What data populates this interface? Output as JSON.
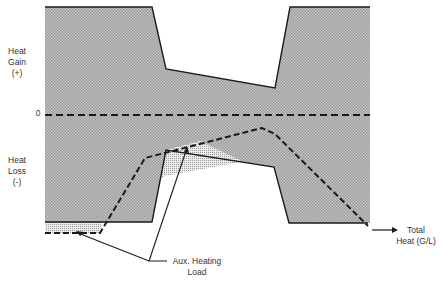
{
  "diagram": {
    "labels": {
      "heat_gain": [
        "Heat",
        "Gain",
        "(+)"
      ],
      "zero": "0",
      "heat_loss": [
        "Heat",
        "Loss",
        "(-)"
      ],
      "total_heat": [
        "Total",
        "Heat (G/L)"
      ],
      "aux_heating": [
        "Aux. Heating",
        "Load"
      ]
    },
    "colors": {
      "gain_fill": "#b8b8b8",
      "loss_fill": "#b8b8b8",
      "aux_fill": "#dcdcdc",
      "line": "#1a1a1a"
    }
  }
}
